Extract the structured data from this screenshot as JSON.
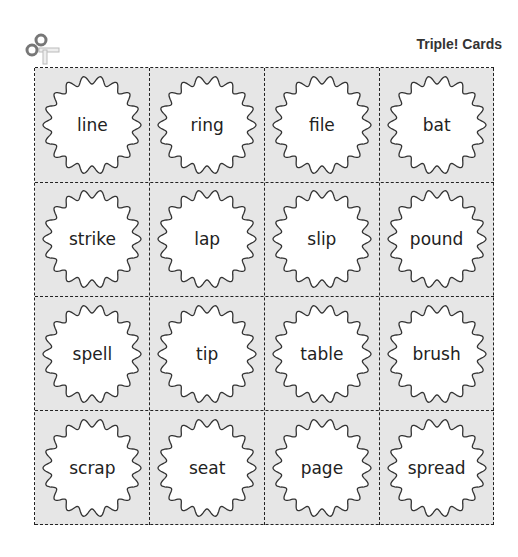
{
  "header": {
    "title": "Triple! Cards",
    "icon": "scissors-icon"
  },
  "cards": [
    [
      "line",
      "ring",
      "file",
      "bat"
    ],
    [
      "strike",
      "lap",
      "slip",
      "pound"
    ],
    [
      "spell",
      "tip",
      "table",
      "brush"
    ],
    [
      "scrap",
      "seat",
      "page",
      "spread"
    ]
  ],
  "colors": {
    "cell_bg": "#e6e6e6",
    "badge_fill": "#ffffff",
    "outline": "#333333"
  }
}
